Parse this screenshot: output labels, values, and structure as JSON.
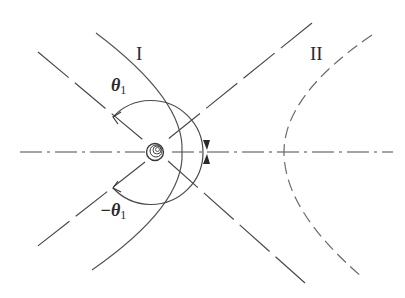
{
  "figure": {
    "labels": {
      "curve_one": "I",
      "curve_two": "II",
      "theta_symbol": "θ",
      "theta_subscript": "1",
      "neg_theta_symbol": "−θ",
      "neg_theta_subscript": "1"
    },
    "caption_visible_fragment": "",
    "colors": {
      "stroke": "#4a4a4a",
      "dashed_stroke": "#6a6a6a",
      "background": "#ffffff"
    }
  }
}
